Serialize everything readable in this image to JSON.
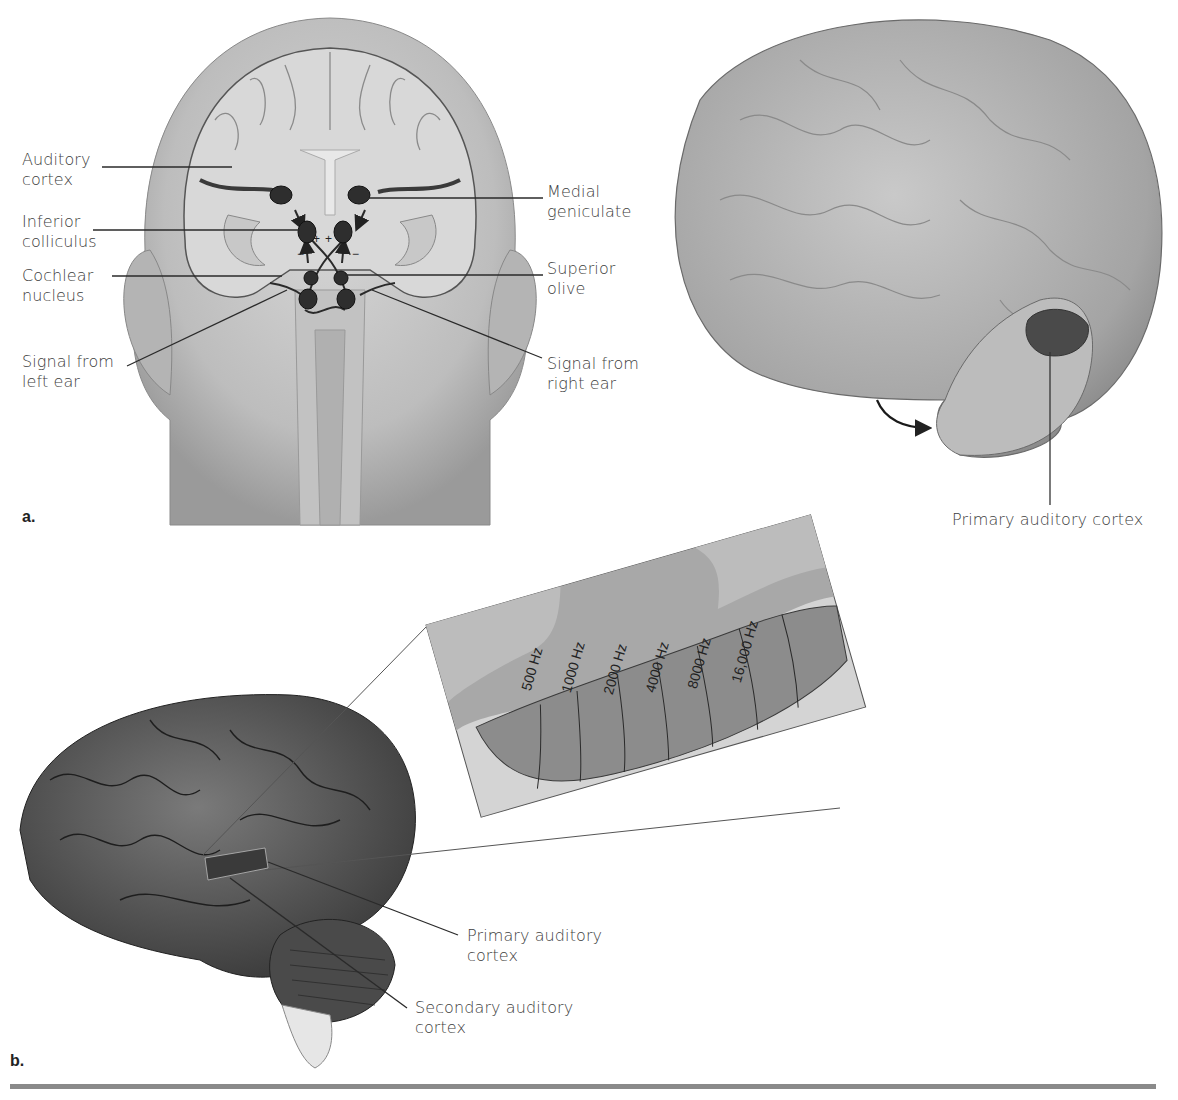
{
  "figure": {
    "panel_a": {
      "letter": "a.",
      "head_labels": {
        "auditory_cortex": [
          "Auditory",
          "cortex"
        ],
        "inferior_colliculus": [
          "Inferior",
          "colliculus"
        ],
        "cochlear_nucleus": [
          "Cochlear",
          "nucleus"
        ],
        "signal_left": [
          "Signal from",
          "left ear"
        ],
        "medial_geniculate": [
          "Medial",
          "geniculate"
        ],
        "superior_olive": [
          "Superior",
          "olive"
        ],
        "signal_right": [
          "Signal from",
          "right ear"
        ]
      },
      "brain_label": "Primary auditory cortex"
    },
    "panel_b": {
      "letter": "b.",
      "frequencies": [
        "500 Hz",
        "1000 Hz",
        "2000 Hz",
        "4000 Hz",
        "8000 Hz",
        "16,000 Hz"
      ],
      "labels": {
        "primary": [
          "Primary auditory",
          "cortex"
        ],
        "secondary": [
          "Secondary auditory",
          "cortex"
        ]
      }
    },
    "colors": {
      "background": "#ffffff",
      "text": "#404040",
      "line": "#2a2a2a",
      "brain_light": "#b8b8b8",
      "brain_dark": "#5a5a5a",
      "tonotopic_band": "#8c8c8c",
      "rule": "#8a8a8a"
    }
  }
}
